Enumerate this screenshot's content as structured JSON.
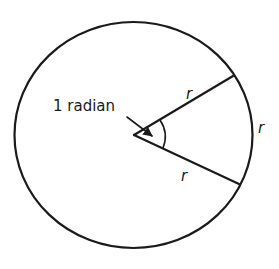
{
  "diagram": {
    "colors": {
      "ink": "#1a1a1a",
      "background": "#ffffff"
    },
    "circle": {
      "cx": 133.5,
      "cy": 135,
      "rx": 119,
      "ry": 113
    },
    "center": {
      "x": 134,
      "y": 135
    },
    "radii": [
      {
        "x2": 233,
        "y2": 76,
        "label": "r"
      },
      {
        "x2": 239,
        "y2": 184,
        "label": "r"
      }
    ],
    "arc_label": "r",
    "angle_label": "1 radian"
  }
}
